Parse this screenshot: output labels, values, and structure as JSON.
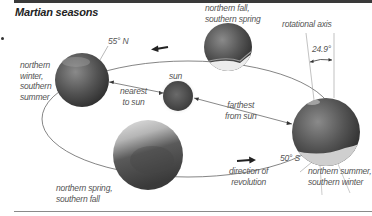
{
  "title": "Martian seasons",
  "labels": {
    "northern_winter": [
      "northern",
      "winter,",
      "southern",
      "summer"
    ],
    "northern_fall": [
      "northern fall,",
      "southern spring"
    ],
    "northern_summer": [
      "northern summer,",
      "southern winter"
    ],
    "northern_spring": [
      "northern spring,",
      "southern fall"
    ],
    "sun": "sun",
    "nearest": [
      "nearest",
      "to sun"
    ],
    "farthest": [
      "farthest",
      "from sun"
    ],
    "rotational_axis": "rotational axis",
    "tilt": "24.9°",
    "lat_north": "55° N",
    "lat_south": "50° S",
    "direction": [
      "direction of",
      "revolution"
    ]
  },
  "colors": {
    "planet_dark": "#3f3f3f",
    "planet_mid": "#6e6e6e",
    "planet_light": "#d8d8d8",
    "orbit_line": "#555555",
    "label_text": "#555555",
    "rule": "#3a3a3a"
  }
}
